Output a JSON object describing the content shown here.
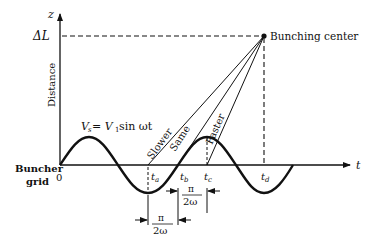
{
  "diagram": {
    "axes": {
      "y_label": "z",
      "y_title": "Distance",
      "x_label": "t",
      "origin": "0",
      "delta_l": "ΔL"
    },
    "equation": {
      "lhs": "V",
      "lhs_sub": "s",
      "rhs": " = V",
      "rhs_sub": "1",
      "rhs_tail": " sin ωt"
    },
    "grid_label_1": "Buncher",
    "grid_label_2": "grid",
    "bunching_center": "Bunching center",
    "trajectories": [
      {
        "label": "Slower",
        "start": "t_a"
      },
      {
        "label": "Same",
        "start": "t_b"
      },
      {
        "label": "Faster",
        "start": "t_c"
      }
    ],
    "time_marks": [
      {
        "main": "t",
        "sub": "a"
      },
      {
        "main": "t",
        "sub": "b"
      },
      {
        "main": "t",
        "sub": "c"
      },
      {
        "main": "t",
        "sub": "d"
      }
    ],
    "intervals": [
      {
        "num": "π",
        "den": "2ω",
        "between": "t_b–t_c"
      },
      {
        "num": "π",
        "den": "2ω",
        "between": "t_a–t_b"
      }
    ],
    "colors": {
      "ink": "#111111",
      "background": "#ffffff"
    }
  }
}
